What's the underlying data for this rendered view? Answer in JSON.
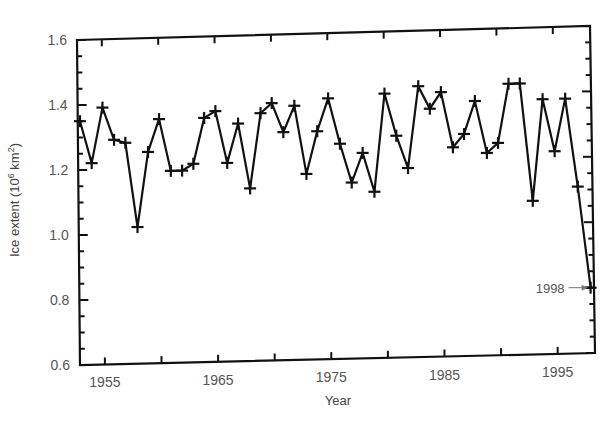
{
  "chart_data": {
    "type": "line",
    "title": "",
    "xlabel": "Year",
    "ylabel": "Ice extent (10⁶ km²)",
    "ylabel_parts": {
      "main": "Ice extent (10",
      "sup1": "6",
      "mid": " km",
      "sup2": "2",
      "end": ")"
    },
    "xlim": [
      1952.8,
      1998.3
    ],
    "ylim": [
      0.6,
      1.6
    ],
    "grid": false,
    "legend": null,
    "x_ticks": [
      1955,
      1960,
      1965,
      1970,
      1975,
      1980,
      1985,
      1990,
      1995
    ],
    "x_tick_labels": [
      {
        "value": 1955,
        "label": "1955"
      },
      {
        "value": 1965,
        "label": "1965"
      },
      {
        "value": 1975,
        "label": "1975"
      },
      {
        "value": 1985,
        "label": "1985"
      },
      {
        "value": 1995,
        "label": "1995"
      }
    ],
    "y_ticks_minor_step": 0.05,
    "y_tick_labels": [
      {
        "value": 0.6,
        "label": "0.6"
      },
      {
        "value": 0.8,
        "label": "0.8"
      },
      {
        "value": 1.0,
        "label": "1.0"
      },
      {
        "value": 1.2,
        "label": "1.2"
      },
      {
        "value": 1.4,
        "label": "1.4"
      },
      {
        "value": 1.6,
        "label": "1.6"
      }
    ],
    "marker": "plus",
    "series": [
      {
        "name": "Ice extent",
        "x": [
          1953,
          1954,
          1955,
          1956,
          1957,
          1958,
          1959,
          1960,
          1961,
          1962,
          1963,
          1964,
          1965,
          1966,
          1967,
          1968,
          1969,
          1970,
          1971,
          1972,
          1973,
          1974,
          1975,
          1976,
          1977,
          1978,
          1979,
          1980,
          1981,
          1982,
          1983,
          1984,
          1985,
          1986,
          1987,
          1988,
          1989,
          1990,
          1991,
          1992,
          1993,
          1994,
          1995,
          1996,
          1997,
          1998
        ],
        "values": [
          1.35,
          1.22,
          1.39,
          1.29,
          1.28,
          1.02,
          1.25,
          1.35,
          1.19,
          1.19,
          1.21,
          1.35,
          1.37,
          1.21,
          1.33,
          1.13,
          1.36,
          1.39,
          1.3,
          1.38,
          1.17,
          1.3,
          1.4,
          1.26,
          1.14,
          1.23,
          1.11,
          1.41,
          1.28,
          1.18,
          1.43,
          1.36,
          1.41,
          1.24,
          1.28,
          1.38,
          1.22,
          1.25,
          1.43,
          1.43,
          1.07,
          1.38,
          1.22,
          1.38,
          1.11,
          0.8
        ]
      }
    ],
    "annotations": [
      {
        "text": "1998",
        "x": 1998,
        "y": 0.8,
        "arrow": true
      }
    ]
  },
  "style": {
    "line_color": "#111111",
    "axis_color": "#111111",
    "text_color": "#555555"
  }
}
